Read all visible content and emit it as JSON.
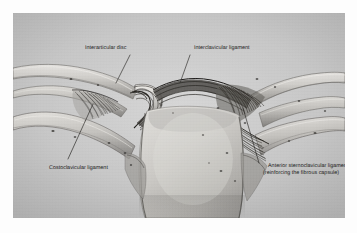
{
  "figure": {
    "kind": "anatomical-illustration",
    "plate_background_color": "#c9c9c9",
    "page_background_color": "#fdfdfd",
    "label_text_color": "#1b1b1b",
    "leader_line_color": "#2b2b2b"
  },
  "labels": {
    "interarticular_disc": "Interarticular disc",
    "interclavicular_ligament": "Interclavicular ligament",
    "costoclavicular_ligament": "Costoclavicular ligament",
    "anterior_sternoclavicular_ligament": "Anterior sternoclavicular ligament (reinforcing the fibrous capsule)"
  },
  "anatomy_parts": [
    "left-clavicle",
    "right-clavicle",
    "left-first-rib",
    "right-first-rib",
    "manubrium-of-sternum",
    "sternoclavicular-joint-left",
    "sternoclavicular-joint-right",
    "interarticular-disc",
    "interclavicular-ligament",
    "costoclavicular-ligament",
    "anterior-sternoclavicular-ligament"
  ]
}
